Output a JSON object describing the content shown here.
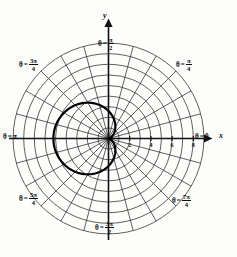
{
  "figure": {
    "background_color": "#fdfdfc",
    "ink_color": "#0d0d0d",
    "grid_color": "#2b2b2b",
    "curve_color": "#000000"
  },
  "axes": {
    "x_label": "x",
    "y_label": "y",
    "x_ticks": [
      "2",
      "4",
      "6",
      "8"
    ],
    "tick_values": [
      2,
      4,
      6,
      8
    ]
  },
  "angle_labels": [
    {
      "id": "theta-0",
      "theta_text": "θ",
      "equals": "=",
      "value": "0",
      "kind": "plain",
      "degrees": 0
    },
    {
      "id": "theta-pi-4",
      "theta_text": "θ",
      "equals": "=",
      "num": "π",
      "den": "4",
      "kind": "frac",
      "degrees": 45
    },
    {
      "id": "theta-pi-2",
      "theta_text": "θ",
      "equals": "=",
      "num": "π",
      "den": "2",
      "kind": "frac",
      "degrees": 90
    },
    {
      "id": "theta-3pi-4",
      "theta_text": "θ",
      "equals": "=",
      "num": "3π",
      "den": "4",
      "kind": "frac",
      "degrees": 135
    },
    {
      "id": "theta-pi",
      "theta_text": "θ",
      "equals": "=",
      "value": "π",
      "kind": "plain",
      "degrees": 180
    },
    {
      "id": "theta-5pi-4",
      "theta_text": "θ",
      "equals": "=",
      "num": "5π",
      "den": "4",
      "kind": "frac",
      "degrees": 225
    },
    {
      "id": "theta-3pi-2",
      "theta_text": "θ",
      "equals": "=",
      "num": "3π",
      "den": "2",
      "kind": "frac",
      "degrees": 270
    },
    {
      "id": "theta-7pi-4",
      "theta_text": "θ",
      "equals": "=",
      "num": "7π",
      "den": "4",
      "kind": "frac",
      "degrees": 315
    }
  ],
  "chart_data": {
    "type": "line",
    "coordinate_system": "polar",
    "xlabel": "x",
    "ylabel": "y",
    "grid": true,
    "legend": "none",
    "polar_grid": {
      "radial_circles": 9,
      "circle_radii": [
        1,
        2,
        3,
        4,
        5,
        6,
        7,
        8,
        9
      ],
      "angular_spokes": 24,
      "spoke_spacing_degrees": 15,
      "labeled_angles_radians": [
        "0",
        "pi/4",
        "pi/2",
        "3pi/4",
        "pi",
        "5pi/4",
        "3pi/2",
        "7pi/4"
      ],
      "labeled_angles_degrees": [
        0,
        45,
        90,
        135,
        180,
        225,
        270,
        315
      ]
    },
    "axis_ticks": {
      "x_positive": [
        2,
        4,
        6,
        8
      ]
    },
    "rlim": [
      0,
      9
    ],
    "series": [
      {
        "name": "cardioid",
        "equation": "r = a(1 - cos(theta))",
        "amplitude_a": 2.6,
        "max_r": 5.2,
        "max_r_at_theta_degrees": 180,
        "cusp_at_theta_degrees": 0,
        "theta_degrees": [
          0,
          15,
          30,
          45,
          60,
          75,
          90,
          105,
          120,
          135,
          150,
          165,
          180,
          195,
          210,
          225,
          240,
          255,
          270,
          285,
          300,
          315,
          330,
          345,
          360
        ],
        "r_values": [
          0.0,
          0.09,
          0.35,
          0.76,
          1.3,
          1.93,
          2.6,
          3.27,
          3.9,
          4.44,
          4.85,
          5.11,
          5.2,
          5.11,
          4.85,
          4.44,
          3.9,
          3.27,
          2.6,
          1.93,
          1.3,
          0.76,
          0.35,
          0.09,
          0.0
        ]
      }
    ]
  }
}
